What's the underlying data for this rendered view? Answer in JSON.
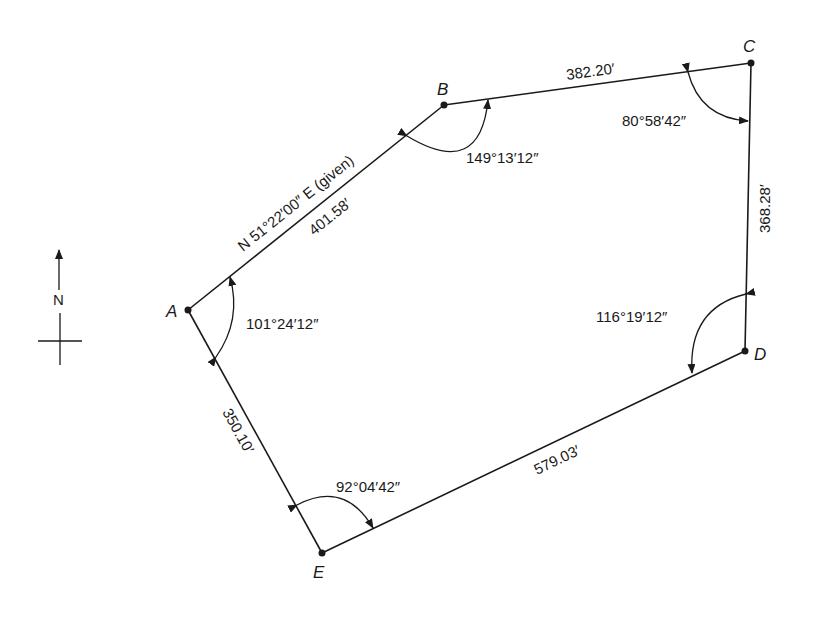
{
  "figure": {
    "type": "traverse-diagram",
    "north_arrow": {
      "label": "N"
    },
    "stations": [
      {
        "name": "A",
        "x": 188,
        "y": 310
      },
      {
        "name": "B",
        "x": 444,
        "y": 105
      },
      {
        "name": "C",
        "x": 751,
        "y": 63
      },
      {
        "name": "D",
        "x": 745,
        "y": 351
      },
      {
        "name": "E",
        "x": 322,
        "y": 553
      }
    ],
    "courses": [
      {
        "from": "A",
        "to": "B",
        "length": "401.58′",
        "bearing": "N 51°22′00″ E (given)"
      },
      {
        "from": "B",
        "to": "C",
        "length": "382.20′"
      },
      {
        "from": "C",
        "to": "D",
        "length": "368.28′"
      },
      {
        "from": "D",
        "to": "E",
        "length": "579.03′"
      },
      {
        "from": "E",
        "to": "A",
        "length": "350.10′"
      }
    ],
    "interior_angles": [
      {
        "station": "A",
        "value": "101°24′12″"
      },
      {
        "station": "B",
        "value": "149°13′12″"
      },
      {
        "station": "C",
        "value": "80°58′42″"
      },
      {
        "station": "D",
        "value": "116°19′12″"
      },
      {
        "station": "E",
        "value": "92°04′42″"
      }
    ]
  }
}
